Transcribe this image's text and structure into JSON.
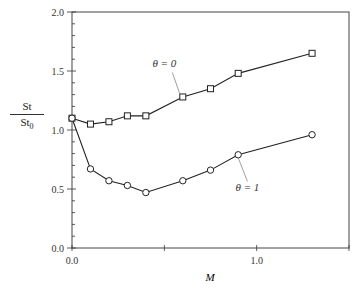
{
  "chart_data": {
    "type": "line",
    "title": "",
    "xlabel": "M",
    "ylabel": "St / St0",
    "ylabel_parts": {
      "numerator": "St",
      "denominator": "St",
      "subscript": "0"
    },
    "xlim": [
      0.0,
      1.5
    ],
    "ylim": [
      0.0,
      2.0
    ],
    "x_ticks": [
      0.0,
      0.5,
      1.0,
      1.5
    ],
    "x_tick_labels": [
      "0.0",
      "",
      "1.0",
      ""
    ],
    "y_ticks": [
      0.0,
      0.5,
      1.0,
      1.5,
      2.0
    ],
    "y_tick_labels": [
      "0.0",
      "0.5",
      "1.0",
      "1.5",
      "2.0"
    ],
    "y_minor_step": 0.1,
    "grid": false,
    "legend": "none (inline annotations)",
    "series": [
      {
        "name": "θ = 0",
        "marker": "square",
        "x": [
          0.0,
          0.1,
          0.2,
          0.3,
          0.4,
          0.6,
          0.75,
          0.9,
          1.3
        ],
        "values": [
          1.1,
          1.05,
          1.07,
          1.12,
          1.12,
          1.28,
          1.35,
          1.48,
          1.65
        ]
      },
      {
        "name": "θ = 1",
        "marker": "circle",
        "x": [
          0.0,
          0.1,
          0.2,
          0.3,
          0.4,
          0.6,
          0.75,
          0.9,
          1.3
        ],
        "values": [
          1.1,
          0.67,
          0.57,
          0.53,
          0.47,
          0.57,
          0.66,
          0.79,
          0.96
        ]
      }
    ],
    "annotations": [
      {
        "text": "θ = 0",
        "label_x": 0.5,
        "label_y": 1.53,
        "points_to": {
          "x": 0.6,
          "y": 1.28
        }
      },
      {
        "text": "θ = 1",
        "label_x": 0.95,
        "label_y": 0.48,
        "points_to": {
          "x": 0.9,
          "y": 0.79
        }
      }
    ]
  }
}
